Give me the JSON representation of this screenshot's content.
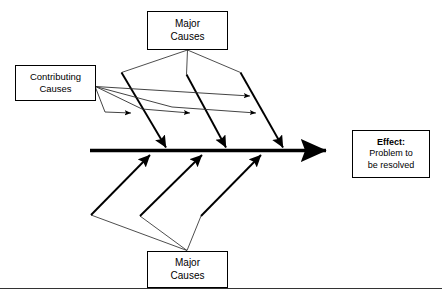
{
  "diagram": {
    "type": "fishbone-ishikawa",
    "title_visible": false,
    "background_color": "#ffffff",
    "line_color": "#000000",
    "boxes": {
      "major_causes_top": {
        "line1": "Major",
        "line2": "Causes"
      },
      "major_causes_bottom": {
        "line1": "Major",
        "line2": "Causes"
      },
      "contributing_causes": {
        "line1": "Contributing",
        "line2": "Causes"
      },
      "effect": {
        "line1": "Effect:",
        "line2": "Problem to",
        "line3": "be resolved"
      }
    },
    "spine": {
      "name": "main-spine-arrow",
      "direction": "left-to-right",
      "arrowhead": "right"
    },
    "bones": {
      "upper_count": 3,
      "lower_count": 3,
      "contributing_arrow_count": 5
    }
  }
}
